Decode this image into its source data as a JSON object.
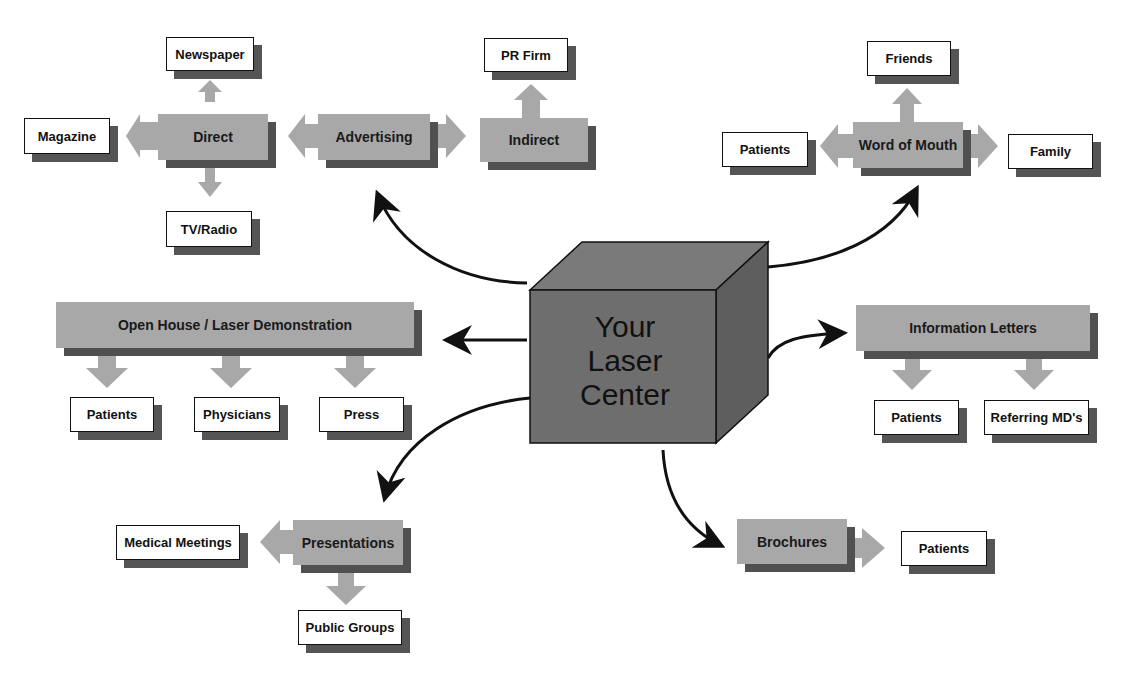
{
  "center": {
    "lines": [
      "Your",
      "Laser",
      "Center"
    ]
  },
  "advertising": {
    "label": "Advertising",
    "direct": {
      "label": "Direct",
      "targets": [
        "Newspaper",
        "Magazine",
        "TV/Radio"
      ]
    },
    "indirect": {
      "label": "Indirect",
      "targets": [
        "PR Firm"
      ]
    }
  },
  "word_of_mouth": {
    "label": "Word of Mouth",
    "targets": [
      "Friends",
      "Patients",
      "Family"
    ]
  },
  "open_house": {
    "label": "Open House / Laser Demonstration",
    "targets": [
      "Patients",
      "Physicians",
      "Press"
    ]
  },
  "information_letters": {
    "label": "Information Letters",
    "targets": [
      "Patients",
      "Referring MD's"
    ]
  },
  "presentations": {
    "label": "Presentations",
    "targets": [
      "Medical Meetings",
      "Public Groups"
    ]
  },
  "brochures": {
    "label": "Brochures",
    "targets": [
      "Patients"
    ]
  },
  "colors": {
    "gray_box": "#a8a8a8",
    "shadow": "#505050",
    "cube_front": "#6e6e6e",
    "cube_top": "#7a7a7a",
    "cube_side": "#5e5e5e",
    "ink": "#111111"
  }
}
